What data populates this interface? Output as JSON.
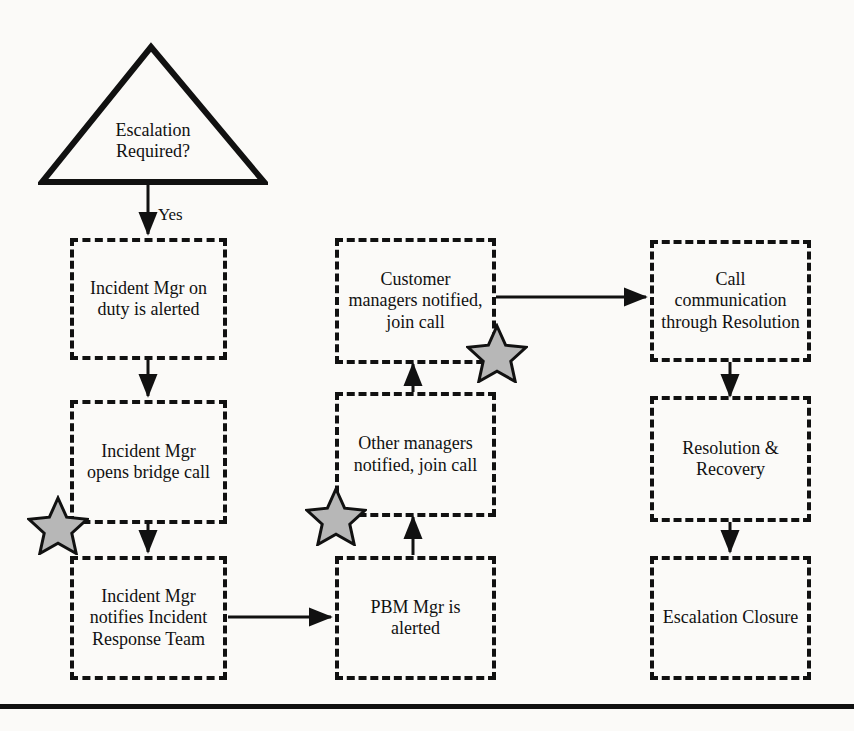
{
  "diagram": {
    "decision": {
      "name": "escalation-required-decision",
      "text_line1": "Escalation",
      "text_line2": "Required?",
      "shape": "triangle"
    },
    "edge_labels": {
      "yes": "Yes"
    },
    "columns": {
      "left": [
        {
          "id": "incident-mgr-alerted",
          "text": "Incident Mgr on duty is alerted"
        },
        {
          "id": "incident-mgr-bridge-call",
          "text": "Incident Mgr opens bridge call"
        },
        {
          "id": "incident-mgr-notifies-team",
          "text": "Incident Mgr notifies Incident Response Team"
        }
      ],
      "middle": [
        {
          "id": "customer-managers-notified",
          "text": "Customer managers notified, join call"
        },
        {
          "id": "other-managers-notified",
          "text": "Other managers notified, join call"
        },
        {
          "id": "pbm-mgr-alerted",
          "text": "PBM Mgr is alerted"
        }
      ],
      "right": [
        {
          "id": "call-communication-resolution",
          "text": "Call communication through Resolution"
        },
        {
          "id": "resolution-recovery",
          "text": "Resolution & Recovery"
        },
        {
          "id": "escalation-closure",
          "text": "Escalation Closure"
        }
      ]
    },
    "markers": [
      {
        "id": "star-marker-1",
        "shape": "five-point-star",
        "near": "incident-mgr-bridge-call"
      },
      {
        "id": "star-marker-2",
        "shape": "five-point-star",
        "near": "other-managers-notified"
      },
      {
        "id": "star-marker-3",
        "shape": "five-point-star",
        "near": "customer-managers-notified"
      }
    ],
    "colors": {
      "stroke": "#111111",
      "star_fill": "#b7b7b7",
      "background": "#fbfaf8"
    }
  }
}
